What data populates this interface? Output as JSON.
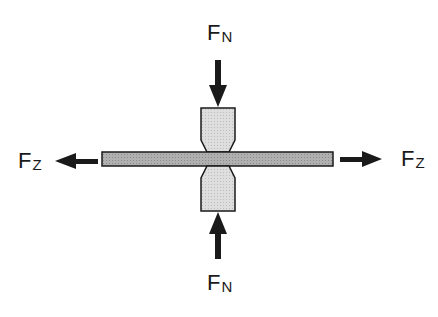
{
  "diagram": {
    "labels": {
      "top_force": {
        "main": "F",
        "sub": "N"
      },
      "bottom_force": {
        "main": "F",
        "sub": "N"
      },
      "left_force": {
        "main": "F",
        "sub": "Z"
      },
      "right_force": {
        "main": "F",
        "sub": "Z"
      }
    },
    "colors": {
      "electrode_fill": "#d9d9d9",
      "sheet_fill": "#a8a8a8",
      "stroke": "#1a1a1a",
      "arrow": "#1a1a1a"
    }
  }
}
